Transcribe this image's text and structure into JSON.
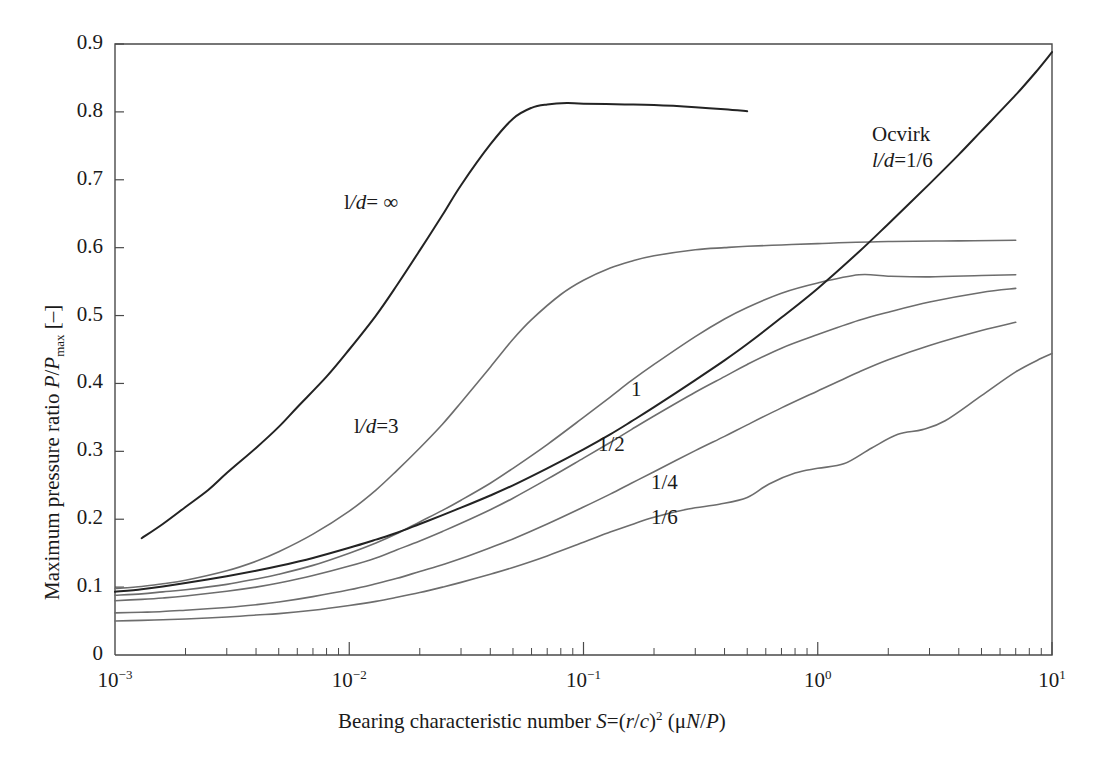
{
  "chart_data": {
    "type": "line",
    "title": "",
    "xlabel": "Bearing characteristic number S=(r/c)2 (μN/P)",
    "xlabel_parts": {
      "lead": "Bearing characteristic number ",
      "s": "S",
      "eq": "=(",
      "r": "r",
      "slash": "/",
      "c": "c",
      "close": ")",
      "exp": "2",
      "tail_open": " (μ",
      "n": "N",
      "slash2": "/",
      "p": "P",
      "tail_close": ")"
    },
    "ylabel": "Maximum pressure ratio P/Pmax [–]",
    "ylabel_parts": {
      "lead": "Maximum pressure ratio ",
      "p1": "P",
      "slash": "/",
      "p2": "P",
      "sub": "max",
      "unit": " [–]"
    },
    "xscale": "log",
    "yscale": "linear",
    "xlim": [
      0.001,
      10
    ],
    "ylim": [
      0,
      0.9
    ],
    "grid": false,
    "legend_position": "inline-annotations",
    "xticks": [
      {
        "value": 0.001,
        "mantissa": "10",
        "exponent": "−3"
      },
      {
        "value": 0.01,
        "mantissa": "10",
        "exponent": "−2"
      },
      {
        "value": 0.1,
        "mantissa": "10",
        "exponent": "−1"
      },
      {
        "value": 1,
        "mantissa": "10",
        "exponent": "0"
      },
      {
        "value": 10,
        "mantissa": "10",
        "exponent": "1"
      }
    ],
    "yticks": [
      "0",
      "0.1",
      "0.2",
      "0.3",
      "0.4",
      "0.5",
      "0.6",
      "0.7",
      "0.8",
      "0.9"
    ],
    "series": [
      {
        "name": "l/d = ∞",
        "color": "#232323",
        "emphasis": true,
        "points": [
          [
            0.0013,
            0.172
          ],
          [
            0.0016,
            0.193
          ],
          [
            0.002,
            0.218
          ],
          [
            0.0025,
            0.243
          ],
          [
            0.003,
            0.268
          ],
          [
            0.004,
            0.305
          ],
          [
            0.005,
            0.336
          ],
          [
            0.006,
            0.365
          ],
          [
            0.008,
            0.41
          ],
          [
            0.01,
            0.45
          ],
          [
            0.013,
            0.5
          ],
          [
            0.016,
            0.545
          ],
          [
            0.02,
            0.596
          ],
          [
            0.025,
            0.648
          ],
          [
            0.03,
            0.692
          ],
          [
            0.04,
            0.752
          ],
          [
            0.05,
            0.79
          ],
          [
            0.06,
            0.806
          ],
          [
            0.07,
            0.811
          ],
          [
            0.085,
            0.813
          ],
          [
            0.1,
            0.812
          ],
          [
            0.15,
            0.811
          ],
          [
            0.2,
            0.81
          ],
          [
            0.3,
            0.807
          ],
          [
            0.4,
            0.804
          ],
          [
            0.5,
            0.801
          ]
        ]
      },
      {
        "name": "l/d = 3",
        "color": "#6d6d6d",
        "emphasis": false,
        "points": [
          [
            0.001,
            0.098
          ],
          [
            0.0013,
            0.101
          ],
          [
            0.0016,
            0.105
          ],
          [
            0.002,
            0.11
          ],
          [
            0.003,
            0.124
          ],
          [
            0.004,
            0.138
          ],
          [
            0.005,
            0.152
          ],
          [
            0.007,
            0.178
          ],
          [
            0.01,
            0.212
          ],
          [
            0.013,
            0.243
          ],
          [
            0.016,
            0.272
          ],
          [
            0.02,
            0.305
          ],
          [
            0.025,
            0.34
          ],
          [
            0.03,
            0.372
          ],
          [
            0.04,
            0.424
          ],
          [
            0.05,
            0.465
          ],
          [
            0.06,
            0.494
          ],
          [
            0.08,
            0.531
          ],
          [
            0.1,
            0.552
          ],
          [
            0.13,
            0.57
          ],
          [
            0.16,
            0.58
          ],
          [
            0.2,
            0.588
          ],
          [
            0.3,
            0.597
          ],
          [
            0.4,
            0.6
          ],
          [
            0.5,
            0.602
          ],
          [
            0.7,
            0.604
          ],
          [
            1.0,
            0.606
          ],
          [
            2.0,
            0.609
          ],
          [
            4.0,
            0.61
          ],
          [
            7.0,
            0.611
          ]
        ]
      },
      {
        "name": "1",
        "color": "#6d6d6d",
        "emphasis": false,
        "points": [
          [
            0.001,
            0.088
          ],
          [
            0.0013,
            0.09
          ],
          [
            0.0016,
            0.093
          ],
          [
            0.002,
            0.096
          ],
          [
            0.003,
            0.104
          ],
          [
            0.004,
            0.112
          ],
          [
            0.005,
            0.119
          ],
          [
            0.007,
            0.132
          ],
          [
            0.01,
            0.15
          ],
          [
            0.013,
            0.165
          ],
          [
            0.016,
            0.179
          ],
          [
            0.02,
            0.196
          ],
          [
            0.025,
            0.213
          ],
          [
            0.03,
            0.228
          ],
          [
            0.04,
            0.253
          ],
          [
            0.05,
            0.275
          ],
          [
            0.07,
            0.31
          ],
          [
            0.1,
            0.35
          ],
          [
            0.13,
            0.38
          ],
          [
            0.16,
            0.404
          ],
          [
            0.2,
            0.428
          ],
          [
            0.3,
            0.469
          ],
          [
            0.4,
            0.495
          ],
          [
            0.5,
            0.512
          ],
          [
            0.7,
            0.533
          ],
          [
            1.0,
            0.548
          ],
          [
            1.5,
            0.56
          ],
          [
            2.0,
            0.558
          ],
          [
            3.0,
            0.557
          ],
          [
            5.0,
            0.559
          ],
          [
            7.0,
            0.56
          ]
        ]
      },
      {
        "name": "1/2",
        "color": "#6d6d6d",
        "emphasis": false,
        "points": [
          [
            0.001,
            0.08
          ],
          [
            0.0013,
            0.082
          ],
          [
            0.0016,
            0.084
          ],
          [
            0.002,
            0.087
          ],
          [
            0.003,
            0.094
          ],
          [
            0.004,
            0.1
          ],
          [
            0.005,
            0.106
          ],
          [
            0.007,
            0.117
          ],
          [
            0.01,
            0.131
          ],
          [
            0.013,
            0.143
          ],
          [
            0.016,
            0.155
          ],
          [
            0.02,
            0.168
          ],
          [
            0.025,
            0.182
          ],
          [
            0.03,
            0.194
          ],
          [
            0.04,
            0.214
          ],
          [
            0.05,
            0.231
          ],
          [
            0.07,
            0.259
          ],
          [
            0.1,
            0.29
          ],
          [
            0.13,
            0.313
          ],
          [
            0.16,
            0.332
          ],
          [
            0.2,
            0.352
          ],
          [
            0.3,
            0.387
          ],
          [
            0.4,
            0.41
          ],
          [
            0.5,
            0.428
          ],
          [
            0.7,
            0.452
          ],
          [
            1.0,
            0.472
          ],
          [
            1.5,
            0.493
          ],
          [
            2.0,
            0.505
          ],
          [
            3.0,
            0.52
          ],
          [
            5.0,
            0.534
          ],
          [
            7.0,
            0.54
          ]
        ]
      },
      {
        "name": "1/4",
        "color": "#6d6d6d",
        "emphasis": false,
        "points": [
          [
            0.001,
            0.062
          ],
          [
            0.0013,
            0.063
          ],
          [
            0.0016,
            0.064
          ],
          [
            0.002,
            0.066
          ],
          [
            0.003,
            0.07
          ],
          [
            0.004,
            0.074
          ],
          [
            0.005,
            0.078
          ],
          [
            0.007,
            0.086
          ],
          [
            0.01,
            0.096
          ],
          [
            0.013,
            0.105
          ],
          [
            0.016,
            0.113
          ],
          [
            0.02,
            0.123
          ],
          [
            0.025,
            0.133
          ],
          [
            0.03,
            0.142
          ],
          [
            0.04,
            0.158
          ],
          [
            0.05,
            0.171
          ],
          [
            0.07,
            0.193
          ],
          [
            0.1,
            0.218
          ],
          [
            0.13,
            0.237
          ],
          [
            0.16,
            0.253
          ],
          [
            0.2,
            0.27
          ],
          [
            0.3,
            0.301
          ],
          [
            0.4,
            0.322
          ],
          [
            0.5,
            0.339
          ],
          [
            0.7,
            0.364
          ],
          [
            1.0,
            0.389
          ],
          [
            1.5,
            0.417
          ],
          [
            2.0,
            0.435
          ],
          [
            3.0,
            0.456
          ],
          [
            5.0,
            0.478
          ],
          [
            7.0,
            0.49
          ]
        ]
      },
      {
        "name": "1/6",
        "color": "#6d6d6d",
        "emphasis": false,
        "points": [
          [
            0.001,
            0.05
          ],
          [
            0.0013,
            0.051
          ],
          [
            0.0016,
            0.052
          ],
          [
            0.002,
            0.053
          ],
          [
            0.003,
            0.056
          ],
          [
            0.004,
            0.059
          ],
          [
            0.005,
            0.061
          ],
          [
            0.007,
            0.066
          ],
          [
            0.01,
            0.073
          ],
          [
            0.013,
            0.079
          ],
          [
            0.016,
            0.085
          ],
          [
            0.02,
            0.092
          ],
          [
            0.025,
            0.1
          ],
          [
            0.03,
            0.107
          ],
          [
            0.04,
            0.119
          ],
          [
            0.05,
            0.129
          ],
          [
            0.07,
            0.146
          ],
          [
            0.1,
            0.166
          ],
          [
            0.13,
            0.181
          ],
          [
            0.16,
            0.192
          ],
          [
            0.2,
            0.203
          ],
          [
            0.28,
            0.215
          ],
          [
            0.38,
            0.222
          ],
          [
            0.5,
            0.232
          ],
          [
            0.62,
            0.252
          ],
          [
            0.8,
            0.268
          ],
          [
            1.0,
            0.275
          ],
          [
            1.3,
            0.282
          ],
          [
            1.7,
            0.305
          ],
          [
            2.2,
            0.325
          ],
          [
            2.8,
            0.332
          ],
          [
            3.5,
            0.345
          ],
          [
            5.0,
            0.382
          ],
          [
            7.0,
            0.417
          ],
          [
            9.0,
            0.437
          ],
          [
            10.0,
            0.444
          ]
        ]
      },
      {
        "name": "Ocvirk l/d=1/6",
        "color": "#232323",
        "emphasis": true,
        "points": [
          [
            0.001,
            0.093
          ],
          [
            0.0013,
            0.097
          ],
          [
            0.0016,
            0.101
          ],
          [
            0.002,
            0.106
          ],
          [
            0.003,
            0.116
          ],
          [
            0.004,
            0.124
          ],
          [
            0.005,
            0.131
          ],
          [
            0.007,
            0.143
          ],
          [
            0.01,
            0.158
          ],
          [
            0.013,
            0.17
          ],
          [
            0.016,
            0.18
          ],
          [
            0.02,
            0.193
          ],
          [
            0.025,
            0.206
          ],
          [
            0.03,
            0.217
          ],
          [
            0.04,
            0.235
          ],
          [
            0.05,
            0.25
          ],
          [
            0.07,
            0.275
          ],
          [
            0.1,
            0.303
          ],
          [
            0.13,
            0.325
          ],
          [
            0.16,
            0.344
          ],
          [
            0.2,
            0.365
          ],
          [
            0.3,
            0.405
          ],
          [
            0.4,
            0.434
          ],
          [
            0.5,
            0.458
          ],
          [
            0.7,
            0.497
          ],
          [
            1.0,
            0.54
          ],
          [
            1.5,
            0.594
          ],
          [
            2.0,
            0.635
          ],
          [
            3.0,
            0.694
          ],
          [
            4.0,
            0.737
          ],
          [
            5.0,
            0.772
          ],
          [
            7.0,
            0.825
          ],
          [
            8.5,
            0.858
          ],
          [
            10.0,
            0.888
          ],
          [
            11.0,
            0.9
          ]
        ]
      }
    ],
    "annotations": [
      {
        "id": "ann-ld-infinity",
        "text": "l/d= ∞",
        "x_px": 344,
        "y_px": 190
      },
      {
        "id": "ann-ocvirk",
        "text": "Ocvirk",
        "x_px": 872,
        "y_px": 122
      },
      {
        "id": "ann-ocvirk-ld",
        "text": "l/d=1/6",
        "x_px": 872,
        "y_px": 148
      },
      {
        "id": "ann-ld-3",
        "text": "l/d=3",
        "x_px": 354,
        "y_px": 414
      },
      {
        "id": "ann-1",
        "text": "1",
        "x_px": 631,
        "y_px": 377
      },
      {
        "id": "ann-1-2",
        "text": "1/2",
        "x_px": 598,
        "y_px": 432
      },
      {
        "id": "ann-1-4",
        "text": "1/4",
        "x_px": 651,
        "y_px": 470
      },
      {
        "id": "ann-1-6",
        "text": "1/6",
        "x_px": 651,
        "y_px": 505
      }
    ]
  },
  "figure": {
    "background": "#ffffff",
    "axis_color": "#4a4a4a",
    "curve_color": "#6d6d6d",
    "curve_color_dark": "#232323"
  }
}
